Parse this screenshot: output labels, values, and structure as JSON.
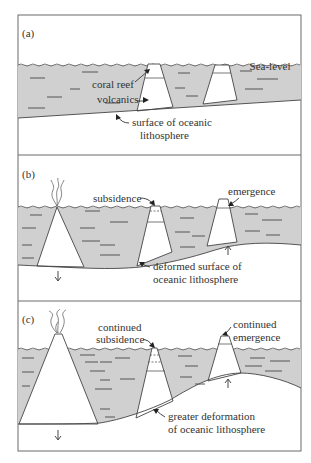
{
  "figure": {
    "panels": [
      {
        "id": "a",
        "label": "(a)",
        "sea_level_label": "Sea-level",
        "annotations": {
          "coral_reef": "coral reef",
          "volcanics": "volcanics",
          "surface_line1": "surface of oceanic",
          "surface_line2": "lithosphere"
        }
      },
      {
        "id": "b",
        "label": "(b)",
        "annotations": {
          "subsidence": "subsidence",
          "emergence": "emergence",
          "surface_line1": "deformed surface of",
          "surface_line2": "oceanic lithosphere"
        }
      },
      {
        "id": "c",
        "label": "(c)",
        "annotations": {
          "subsidence_line1": "continued",
          "subsidence_line2": "subsidence",
          "emergence_line1": "continued",
          "emergence_line2": "emergence",
          "surface_line1": "greater deformation",
          "surface_line2": "of oceanic lithosphere"
        }
      }
    ],
    "colors": {
      "water": "#d0d0d0",
      "frame": "#6a6a6a",
      "line": "#444444"
    }
  }
}
